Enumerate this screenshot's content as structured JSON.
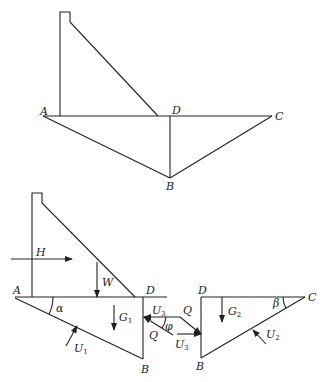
{
  "figure_top": {
    "labels": {
      "A": "A",
      "B": "B",
      "C": "C",
      "D": "D"
    }
  },
  "figure_bottom": {
    "left_block": {
      "points": {
        "A": "A",
        "B": "B",
        "D": "D"
      },
      "forces": {
        "H": "H",
        "W": "W",
        "G1": "G",
        "G1_sub": "1",
        "U1": "U",
        "U1_sub": "1",
        "U3": "U",
        "U3_sub": "3",
        "Q": "Q"
      },
      "angle": "α"
    },
    "interface": {
      "Q_right": "Q",
      "U3_right": "U",
      "U3_right_sub": "3",
      "angle": "φ"
    },
    "right_block": {
      "points": {
        "B": "B",
        "C": "C",
        "D": "D"
      },
      "forces": {
        "G2": "G",
        "G2_sub": "2",
        "U2": "U",
        "U2_sub": "2"
      },
      "angle": "β"
    }
  }
}
